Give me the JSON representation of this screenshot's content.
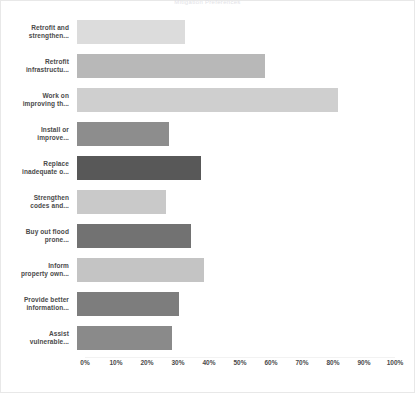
{
  "chart_data": {
    "type": "bar",
    "orientation": "horizontal",
    "title": "Mitigation Preferences",
    "xlabel": "",
    "ylabel": "",
    "xlim": [
      0,
      100
    ],
    "grid": false,
    "legend": "none",
    "tick_labels": [
      "0%",
      "10%",
      "20%",
      "30%",
      "40%",
      "50%",
      "60%",
      "70%",
      "80%",
      "90%",
      "100%"
    ],
    "tick_values": [
      0,
      10,
      20,
      30,
      40,
      50,
      60,
      70,
      80,
      90,
      100
    ],
    "categories": [
      "Retrofit and\nstrengthen...",
      "Retrofit\ninfrastructu...",
      "Work on\nimproving th...",
      "Install or\nimprove...",
      "Replace\ninadequate o...",
      "Strengthen\ncodes and...",
      "Buy out flood\nprone...",
      "Inform\nproperty own...",
      "Provide better\ninformation...",
      "Assist\nvulnerable..."
    ],
    "values": [
      34,
      59,
      82,
      29,
      39,
      28,
      36,
      40,
      32,
      30
    ],
    "colors": [
      "#dcdcdc",
      "#b8b8b8",
      "#cfcfcf",
      "#8d8d8d",
      "#585858",
      "#c9c9c9",
      "#727272",
      "#c4c4c4",
      "#7d7d7d",
      "#8a8a8a"
    ]
  }
}
